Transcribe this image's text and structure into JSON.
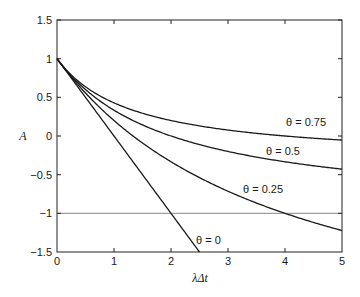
{
  "chart_data": {
    "type": "line",
    "title": "",
    "xlabel": "λΔt",
    "ylabel": "A",
    "xlim": [
      0,
      5
    ],
    "ylim": [
      -1.5,
      1.5
    ],
    "xticks": [
      "0",
      "1",
      "2",
      "3",
      "4",
      "5"
    ],
    "yticks": [
      "1.5",
      "1",
      "0.5",
      "0",
      "−0.5",
      "−1",
      "−1.5"
    ],
    "grid": false,
    "legend": "inline curve labels",
    "reference_line": {
      "y": -1,
      "color": "#888888"
    },
    "x": [
      0,
      0.5,
      1,
      1.5,
      2,
      2.5,
      3,
      3.5,
      4,
      4.5,
      5
    ],
    "series": [
      {
        "name": "θ = 0",
        "label": "θ = 0",
        "values": [
          1,
          0.5,
          0,
          -0.5,
          -1,
          -1.5,
          null,
          null,
          null,
          null,
          null
        ]
      },
      {
        "name": "θ = 0.25",
        "label": "θ = 0.25",
        "values": [
          1,
          0.53,
          0.2,
          -0.05,
          -0.33,
          -0.54,
          -0.71,
          -0.86,
          -1.0,
          -1.11,
          -1.22
        ]
      },
      {
        "name": "θ = 0.5",
        "label": "θ = 0.5",
        "values": [
          1,
          0.6,
          0.33,
          0.14,
          0,
          -0.11,
          -0.2,
          -0.27,
          -0.33,
          -0.38,
          -0.43
        ]
      },
      {
        "name": "θ = 0.75",
        "label": "θ = 0.75",
        "values": [
          1,
          0.68,
          0.43,
          0.26,
          0.12,
          0.07,
          0.04,
          0.02,
          0.0,
          -0.03,
          -0.05
        ]
      }
    ]
  },
  "labels": {
    "xlabel": "λΔt",
    "ylabel": "A",
    "theta0": "θ = 0",
    "theta025": "θ = 0.25",
    "theta05": "θ = 0.5",
    "theta075": "θ = 0.75"
  },
  "ticks": {
    "x": [
      "0",
      "1",
      "2",
      "3",
      "4",
      "5"
    ],
    "y": [
      "1.5",
      "1",
      "0.5",
      "0",
      "−0.5",
      "−1",
      "−1.5"
    ]
  }
}
